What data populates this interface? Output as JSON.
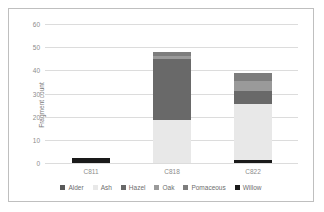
{
  "chart_data": {
    "type": "bar",
    "stacked": true,
    "title": "",
    "xlabel": "",
    "ylabel": "Fragment count",
    "ylim": [
      0,
      60
    ],
    "yticks": [
      0,
      10,
      20,
      30,
      40,
      50,
      60
    ],
    "ytick_labels": [
      "0",
      "10",
      "20",
      "30",
      "40",
      "50",
      "60"
    ],
    "grid": true,
    "legend_position": "bottom",
    "categories": [
      "C811",
      "C818",
      "C822"
    ],
    "series": [
      {
        "name": "Alder",
        "color": "#595959",
        "values": [
          0,
          0,
          0
        ]
      },
      {
        "name": "Ash",
        "color": "#e8e8e8",
        "values": [
          0,
          18.7,
          24
        ]
      },
      {
        "name": "Hazel",
        "color": "#696969",
        "values": [
          0,
          26.3,
          5.5
        ]
      },
      {
        "name": "Oak",
        "color": "#9a9a9a",
        "values": [
          0,
          1.2,
          4.5
        ]
      },
      {
        "name": "Pomaceous",
        "color": "#7d7d7d",
        "values": [
          0,
          1.8,
          3.5
        ]
      },
      {
        "name": "Willow",
        "color": "#1a1a1a",
        "values": [
          2,
          0,
          1.5
        ]
      }
    ],
    "stack_order": [
      "Willow",
      "Ash",
      "Hazel",
      "Oak",
      "Pomaceous",
      "Alder"
    ],
    "bar_totals": [
      2,
      48,
      50
    ]
  },
  "legend": {
    "items": [
      {
        "label": "Alder",
        "color": "#595959"
      },
      {
        "label": "Ash",
        "color": "#e8e8e8"
      },
      {
        "label": "Hazel",
        "color": "#696969"
      },
      {
        "label": "Oak",
        "color": "#9a9a9a"
      },
      {
        "label": "Pomaceous",
        "color": "#7d7d7d"
      },
      {
        "label": "Willow",
        "color": "#1a1a1a"
      }
    ]
  }
}
